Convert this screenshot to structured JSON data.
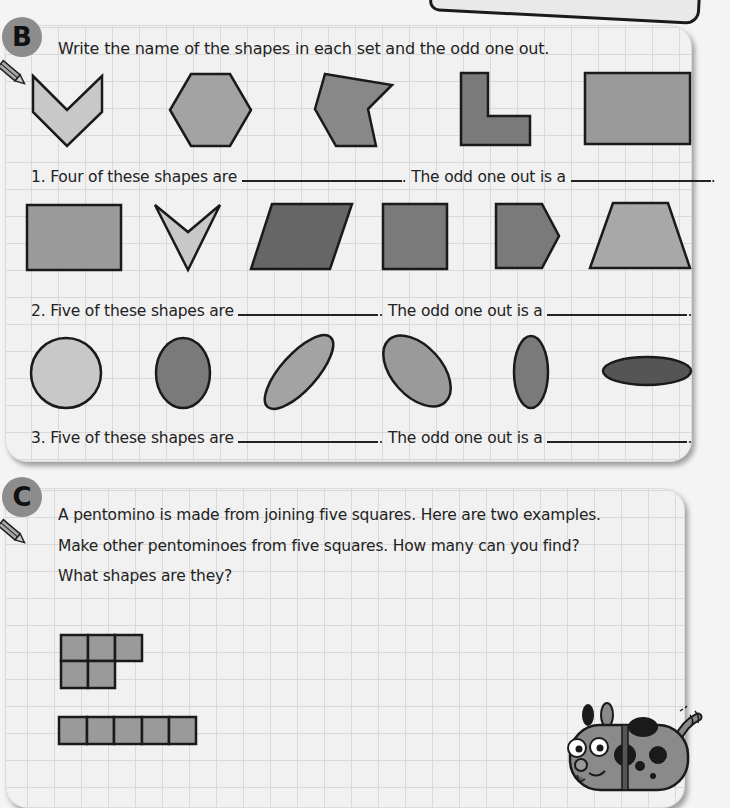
{
  "section_b": {
    "badge": "B",
    "instruction": "Write the name of the shapes in each set and the odd one out.",
    "questions": [
      {
        "number": "1.",
        "prefix": "Four of these shapes are",
        "middle": ". The odd one out is a",
        "suffix": "."
      },
      {
        "number": "2.",
        "prefix": "Five of these shapes are",
        "middle": ". The odd one out is a",
        "suffix": "."
      },
      {
        "number": "3.",
        "prefix": "Five of these shapes are",
        "middle": ". The odd one out is a",
        "suffix": "."
      }
    ],
    "shape_sets": [
      [
        "chevron",
        "hexagon",
        "irregular-hexagon",
        "l-shape",
        "rectangle"
      ],
      [
        "rectangle",
        "arrowhead",
        "parallelogram",
        "square",
        "pentagon",
        "trapezium"
      ],
      [
        "circle",
        "oval",
        "tilted-oval",
        "tilted-oval",
        "narrow-oval",
        "flat-oval"
      ]
    ]
  },
  "section_c": {
    "badge": "C",
    "lines": [
      "A pentomino is made from joining five squares. Here are two examples.",
      "Make other pentominoes from five squares. How many can you find?",
      "What shapes are they?"
    ],
    "examples": [
      "p-pentomino",
      "i-pentomino"
    ]
  },
  "colors": {
    "light_fill": "#c8c8c8",
    "mid_fill": "#9a9a9a",
    "dark_fill": "#6e6e6e",
    "darker_fill": "#555555",
    "outline": "#1a1a1a",
    "badge": "#8c8c8c"
  }
}
